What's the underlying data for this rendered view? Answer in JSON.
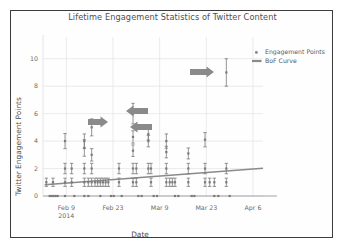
{
  "figure": {
    "border_color": "#3c3c3c",
    "background": "#ffffff"
  },
  "chart_data": {
    "type": "scatter",
    "title": "Lifetime Engagement Statistics of Twitter Content",
    "xlabel": "Date",
    "ylabel": "Twitter Engagement Points",
    "grid": true,
    "legend_position": "upper right",
    "marker_color": "#7a7a7a",
    "line_color": "#8a8a8a",
    "annotation_color": "#8a8a8a",
    "ylim": [
      0,
      11
    ],
    "yticks": [
      0,
      2,
      4,
      6,
      8,
      10
    ],
    "ytick_labels": [
      "0",
      "2",
      "4",
      "6",
      "8",
      "10"
    ],
    "xlim": [
      0,
      66
    ],
    "xticks": [
      7,
      21,
      35,
      49,
      63
    ],
    "xtick_labels": [
      "Feb 9",
      "Feb 23",
      "Mar 9",
      "Mar 23",
      "Apr 6"
    ],
    "xtick_sublabels": [
      "2014",
      "",
      "",
      "",
      ""
    ],
    "legend": [
      {
        "label": "Engagement Points",
        "marker": "square-marker"
      },
      {
        "label": "BoF Curve",
        "marker": "line-marker"
      }
    ],
    "series": [
      {
        "name": "Engagement Points",
        "points": [
          {
            "x": 1.0,
            "y": 1,
            "err": 0.3
          },
          {
            "x": 2.0,
            "y": 0,
            "err": 0.0
          },
          {
            "x": 2.6,
            "y": 0,
            "err": 0.0
          },
          {
            "x": 3.2,
            "y": 0,
            "err": 0.0
          },
          {
            "x": 3.8,
            "y": 0,
            "err": 0.0
          },
          {
            "x": 4.4,
            "y": 0,
            "err": 0.0
          },
          {
            "x": 3.0,
            "y": 1,
            "err": 0.3
          },
          {
            "x": 6.6,
            "y": 4,
            "err": 0.55
          },
          {
            "x": 6.6,
            "y": 2,
            "err": 0.38
          },
          {
            "x": 6.6,
            "y": 1,
            "err": 0.3
          },
          {
            "x": 6.6,
            "y": 0,
            "err": 0.0
          },
          {
            "x": 8.6,
            "y": 2,
            "err": 0.38
          },
          {
            "x": 8.6,
            "y": 1,
            "err": 0.3
          },
          {
            "x": 9.4,
            "y": 0,
            "err": 0.0
          },
          {
            "x": 12.4,
            "y": 4,
            "err": 0.52
          },
          {
            "x": 12.4,
            "y": 3.5,
            "err": 0.6
          },
          {
            "x": 12.4,
            "y": 2,
            "err": 0.38
          },
          {
            "x": 12.4,
            "y": 1,
            "err": 0.3
          },
          {
            "x": 12.4,
            "y": 0,
            "err": 0.0
          },
          {
            "x": 13.6,
            "y": 1,
            "err": 0.3
          },
          {
            "x": 13.6,
            "y": 0,
            "err": 0.0
          },
          {
            "x": 14.6,
            "y": 5,
            "err": 0.62
          },
          {
            "x": 14.6,
            "y": 3,
            "err": 0.45
          },
          {
            "x": 14.6,
            "y": 2,
            "err": 0.38
          },
          {
            "x": 14.6,
            "y": 1,
            "err": 0.3
          },
          {
            "x": 15.6,
            "y": 1,
            "err": 0.3
          },
          {
            "x": 16.4,
            "y": 1,
            "err": 0.3
          },
          {
            "x": 17.2,
            "y": 1,
            "err": 0.3
          },
          {
            "x": 17.2,
            "y": 0,
            "err": 0.0
          },
          {
            "x": 18.0,
            "y": 1,
            "err": 0.3
          },
          {
            "x": 18.8,
            "y": 1,
            "err": 0.3
          },
          {
            "x": 19.6,
            "y": 1,
            "err": 0.3
          },
          {
            "x": 20.4,
            "y": 0,
            "err": 0.0
          },
          {
            "x": 21.2,
            "y": 0,
            "err": 0.0
          },
          {
            "x": 22.8,
            "y": 2,
            "err": 0.38
          },
          {
            "x": 22.8,
            "y": 1,
            "err": 0.3
          },
          {
            "x": 23.6,
            "y": 0,
            "err": 0.0
          },
          {
            "x": 27.0,
            "y": 6,
            "err": 0.75
          },
          {
            "x": 27.0,
            "y": 4.3,
            "err": 0.45
          },
          {
            "x": 27.0,
            "y": 3.3,
            "err": 0.42
          },
          {
            "x": 27.0,
            "y": 2,
            "err": 0.38
          },
          {
            "x": 27.0,
            "y": 1,
            "err": 0.3
          },
          {
            "x": 28.0,
            "y": 2,
            "err": 0.38
          },
          {
            "x": 28.0,
            "y": 1,
            "err": 0.3
          },
          {
            "x": 28.6,
            "y": 0,
            "err": 0.0
          },
          {
            "x": 29.6,
            "y": 0,
            "err": 0.0
          },
          {
            "x": 31.6,
            "y": 4.5,
            "err": 0.42
          },
          {
            "x": 31.6,
            "y": 4,
            "err": 0.42
          },
          {
            "x": 31.6,
            "y": 2,
            "err": 0.38
          },
          {
            "x": 32.4,
            "y": 2,
            "err": 0.38
          },
          {
            "x": 32.4,
            "y": 1,
            "err": 0.3
          },
          {
            "x": 33.2,
            "y": 0,
            "err": 0.0
          },
          {
            "x": 34.2,
            "y": 0,
            "err": 0.0
          },
          {
            "x": 37.0,
            "y": 4,
            "err": 0.52
          },
          {
            "x": 37.0,
            "y": 3.2,
            "err": 0.42
          },
          {
            "x": 37.0,
            "y": 2,
            "err": 0.38
          },
          {
            "x": 37.0,
            "y": 1,
            "err": 0.3
          },
          {
            "x": 38.0,
            "y": 1,
            "err": 0.3
          },
          {
            "x": 38.8,
            "y": 1,
            "err": 0.3
          },
          {
            "x": 39.6,
            "y": 1,
            "err": 0.3
          },
          {
            "x": 39.6,
            "y": 0,
            "err": 0.0
          },
          {
            "x": 40.6,
            "y": 0,
            "err": 0.0
          },
          {
            "x": 43.6,
            "y": 3.1,
            "err": 0.4
          },
          {
            "x": 43.6,
            "y": 2,
            "err": 0.38
          },
          {
            "x": 43.6,
            "y": 1,
            "err": 0.3
          },
          {
            "x": 44.6,
            "y": 0,
            "err": 0.0
          },
          {
            "x": 45.4,
            "y": 0,
            "err": 0.0
          },
          {
            "x": 48.6,
            "y": 4.1,
            "err": 0.52
          },
          {
            "x": 48.6,
            "y": 2,
            "err": 0.38
          },
          {
            "x": 48.6,
            "y": 1,
            "err": 0.3
          },
          {
            "x": 50.0,
            "y": 1,
            "err": 0.3
          },
          {
            "x": 51.4,
            "y": 1,
            "err": 0.3
          },
          {
            "x": 51.4,
            "y": 0,
            "err": 0.0
          },
          {
            "x": 52.6,
            "y": 0,
            "err": 0.0
          },
          {
            "x": 55.0,
            "y": 9,
            "err": 1.0
          },
          {
            "x": 55.0,
            "y": 2,
            "err": 0.38
          },
          {
            "x": 55.0,
            "y": 1,
            "err": 0.3
          },
          {
            "x": 56.0,
            "y": 0,
            "err": 0.0
          }
        ]
      },
      {
        "name": "BoF Curve",
        "type": "line",
        "x": [
          0.5,
          66
        ],
        "y": [
          0.82,
          2.02
        ]
      }
    ],
    "annotations": [
      {
        "name": "arrow-right-feb17",
        "direction": "right",
        "x": 88,
        "y": 122,
        "length": 20,
        "note": "points at ~5 cluster"
      },
      {
        "name": "arrow-left-mar6",
        "direction": "left",
        "x": 148,
        "y": 111,
        "length": 22,
        "note": "points at ~6 peak"
      },
      {
        "name": "arrow-left-mar10",
        "direction": "left",
        "x": 152,
        "y": 127,
        "length": 22,
        "note": "points at ~4.5 cluster"
      },
      {
        "name": "arrow-right-mar28",
        "direction": "right",
        "x": 190,
        "y": 72,
        "length": 24,
        "note": "points at ~9 outlier"
      }
    ]
  }
}
